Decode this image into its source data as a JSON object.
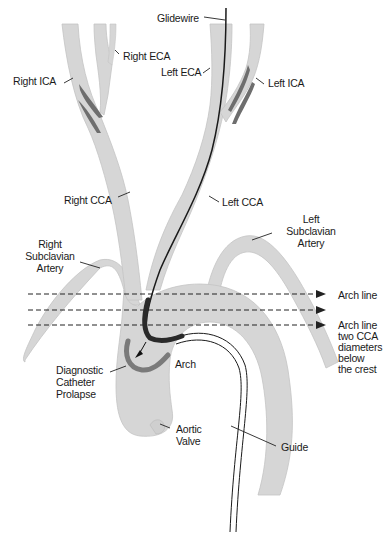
{
  "diagram": {
    "type": "anatomical-illustration",
    "colors": {
      "vessel_fill": "#d6d6d6",
      "vessel_edge": "#bdbdbd",
      "plaque": "#6e6e6e",
      "glidewire": "#1a1a1a",
      "diagnostic_catheter": "#7a7a7a",
      "guide_line": "#1a1a1a",
      "label_text": "#1a1a1a"
    },
    "labels": {
      "glidewire": "Glidewire",
      "right_eca": "Right ECA",
      "left_eca": "Left ECA",
      "right_ica": "Right ICA",
      "left_ica": "Left ICA",
      "right_cca": "Right CCA",
      "left_cca": "Left CCA",
      "right_subclavian": "Right\nSubclavian\nArtery",
      "left_subclavian": "Left\nSubclavian\nArtery",
      "arch_line": "Arch line",
      "arch_line_two": "Arch line\ntwo CCA\ndiameters\nbelow\nthe crest",
      "diagnostic_catheter": "Diagnostic\nCatheter\nProlapse",
      "arch": "Arch",
      "aortic_valve": "Aortic\nValve",
      "guide": "Guide"
    },
    "reference_lines": [
      {
        "name": "arch-line",
        "y": 294,
        "arrow": true
      },
      {
        "name": "middle-line",
        "y": 310,
        "arrow": true
      },
      {
        "name": "two-cca-below-crest",
        "y": 325,
        "arrow": true
      }
    ]
  }
}
